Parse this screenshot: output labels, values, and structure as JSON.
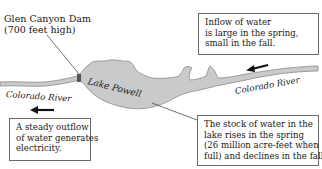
{
  "dam": {
    "name": "Glen Canyon Dam",
    "height_note": "(700 feet high)"
  },
  "lake": {
    "name": "Lake Powell"
  },
  "rivers": {
    "left_label": "Colorado River",
    "right_label": "Colorado River",
    "flow_direction": "right-to-left"
  },
  "callouts": {
    "inflow": [
      "Inflow of water",
      "is large in the spring,",
      "small in the fall."
    ],
    "outflow": [
      "A steady outflow",
      "of water generates",
      "electricity."
    ],
    "stock": [
      "The stock of water in the",
      "lake rises in the spring",
      "(26 million acre-feet when",
      "full) and declines in the fall."
    ]
  },
  "colors": {
    "lake_fill": "#c9cacc",
    "lake_outline": "#8a8a8a",
    "river_fill": "#c9cacc",
    "arrow": "#111111",
    "box_border": "#6b6b6b"
  }
}
